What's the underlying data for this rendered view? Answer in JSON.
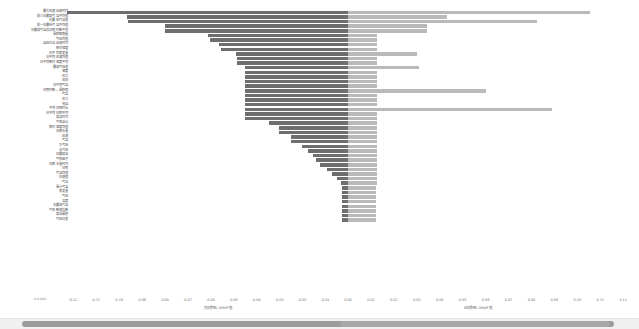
{
  "chart_data": {
    "type": "bar",
    "orientation": "horizontal",
    "style": "diverging-tornado",
    "title": "",
    "xlabel_left": "负向影响—SHAP 值",
    "xlabel_right": "正向影响—SHAP 值",
    "ylabel": "",
    "grid": false,
    "legend_position": "none",
    "xlim": [
      -0.13,
      0.12
    ],
    "xticks": [
      -0.12,
      -0.11,
      -0.1,
      -0.09,
      -0.08,
      -0.07,
      -0.06,
      -0.05,
      -0.04,
      -0.03,
      -0.02,
      -0.01,
      0.0,
      0.01,
      0.02,
      0.03,
      0.04,
      0.05,
      0.06,
      0.07,
      0.08,
      0.09,
      0.1,
      0.11,
      0.12
    ],
    "xtick_labels": [
      "-0.12",
      "-0.11",
      "-0.10",
      "-0.09",
      "-0.08",
      "-0.07",
      "-0.06",
      "-0.05",
      "-0.04",
      "-0.03",
      "-0.02",
      "-0.01",
      "0.00",
      "0.01",
      "0.02",
      "0.03",
      "0.04",
      "0.05",
      "0.06",
      "0.07",
      "0.08",
      "0.09",
      "0.10",
      "0.11",
      "0.12"
    ],
    "corner_note": "0.0.000",
    "series": [
      {
        "name": "负向 SHAP",
        "color": "#6e6e6e"
      },
      {
        "name": "正向 SHAP",
        "color": "#b9b9b9"
      }
    ],
    "categories": [
      "最大风速出现时间",
      "前三日最高气温平均值",
      "日最低气温值",
      "前一日最低气温平均值",
      "日最高气温及日照时数平均",
      "累积降雨量",
      "气压均值",
      "血压升温出现时间",
      "相对湿度",
      "日平均蒸发量",
      "日平均风速均值",
      "日平均相对湿度平均",
      "最高气压值",
      "湿度",
      "风力",
      "风向",
      "日平均气温",
      "日照时数—累积值",
      "气温",
      "风力",
      "地温",
      "平均日照时长",
      "日平均日照平均",
      "高温时间",
      "气象站点",
      "相对湿度均值",
      "日降水量",
      "风速",
      "气温",
      "大气压",
      "水汽压",
      "日最高温",
      "气象因子",
      "日降水量时间",
      "日照",
      "气温均值",
      "风速值",
      "气温",
      "累计气温",
      "蒸发量",
      "气压",
      "温度",
      "年最高气温",
      "气象数值指数",
      "高温累积",
      "气压日差"
    ],
    "neg_values": [
      -0.1225,
      -0.0963,
      -0.0958,
      -0.08,
      -0.08,
      -0.061,
      -0.06,
      -0.0563,
      -0.0555,
      -0.0488,
      -0.0483,
      -0.0483,
      -0.045,
      -0.045,
      -0.045,
      -0.0448,
      -0.0448,
      -0.0448,
      -0.0448,
      -0.0448,
      -0.0448,
      -0.0448,
      -0.0448,
      -0.0448,
      -0.0345,
      -0.03,
      -0.03,
      -0.025,
      -0.025,
      -0.02,
      -0.0173,
      -0.0153,
      -0.014,
      -0.012,
      -0.009,
      -0.007,
      -0.005,
      -0.003,
      -0.0025,
      -0.0025,
      -0.0025,
      -0.0025,
      -0.0025,
      -0.0025,
      -0.0025,
      -0.0025
    ],
    "pos_values": [
      0.1055,
      0.043,
      0.0825,
      0.0343,
      0.0343,
      0.0128,
      0.0128,
      0.0128,
      0.0128,
      0.0303,
      0.0128,
      0.0128,
      0.031,
      0.0128,
      0.0128,
      0.0128,
      0.0128,
      0.06,
      0.0128,
      0.0128,
      0.0128,
      0.089,
      0.0128,
      0.0128,
      0.0128,
      0.0128,
      0.0128,
      0.0128,
      0.0128,
      0.0128,
      0.0128,
      0.0128,
      0.0128,
      0.0128,
      0.0128,
      0.0128,
      0.0128,
      0.0128,
      0.012,
      0.012,
      0.012,
      0.012,
      0.012,
      0.012,
      0.012,
      0.012
    ]
  },
  "scrollbar": {
    "name": "horizontal-scrollbar"
  }
}
